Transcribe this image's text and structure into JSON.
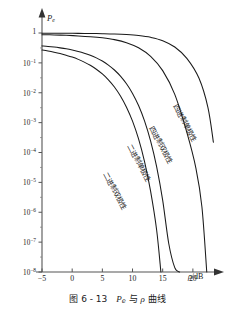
{
  "figure": {
    "caption_prefix": "图",
    "caption_number": "6 - 13",
    "caption_symbol_main": "P",
    "caption_symbol_sub": "e",
    "caption_middle": "与",
    "caption_rho": "ρ",
    "caption_suffix": "曲线",
    "caption_full": "图 6 - 13  Pe 与 ρ 曲线"
  },
  "axes": {
    "y_label_main": "P",
    "y_label_sub": "e",
    "x_label": "ρ/dB",
    "x_label_symbol": "ρ",
    "x_label_unit": "/dB",
    "y_ticks": [
      {
        "mantissa": "1",
        "exponent": "",
        "value": 0
      },
      {
        "mantissa": "10",
        "exponent": "-1",
        "value": -1
      },
      {
        "mantissa": "10",
        "exponent": "-2",
        "value": -2
      },
      {
        "mantissa": "10",
        "exponent": "-3",
        "value": -3
      },
      {
        "mantissa": "10",
        "exponent": "-4",
        "value": -4
      },
      {
        "mantissa": "10",
        "exponent": "-5",
        "value": -5
      },
      {
        "mantissa": "10",
        "exponent": "-6",
        "value": -6
      },
      {
        "mantissa": "10",
        "exponent": "-7",
        "value": -7
      },
      {
        "mantissa": "10",
        "exponent": "-8",
        "value": -8
      }
    ],
    "x_ticks": [
      "-5",
      "0",
      "5",
      "10",
      "15",
      "20"
    ]
  },
  "chart_data": {
    "type": "line",
    "xlabel": "ρ/dB",
    "ylabel": "Pe",
    "xlim": [
      -5,
      23.5
    ],
    "ylim": [
      1e-08,
      1
    ],
    "yscale": "log",
    "grid": false,
    "legend": "inline-curve-labels",
    "line_color": "#1a1a1a",
    "series": [
      {
        "name": "二进制双极性",
        "label_angle_deg": 62,
        "x": [
          -5,
          -4,
          -3,
          -2,
          -1,
          0,
          1,
          2,
          3,
          4,
          5,
          6,
          7,
          8,
          9,
          10,
          11,
          12,
          13,
          14,
          14.7
        ],
        "y": [
          0.27,
          0.25,
          0.228,
          0.205,
          0.18,
          0.156,
          0.131,
          0.106,
          0.0828,
          0.0614,
          0.0425,
          0.0271,
          0.0156,
          0.00782,
          0.00329,
          0.00112,
          0.000285,
          4.9e-05,
          5e-06,
          2.5e-07,
          1e-08
        ]
      },
      {
        "name": "二进制单极性",
        "label_angle_deg": 62,
        "x": [
          -5,
          -4,
          -3,
          -2,
          -1,
          0,
          1,
          2,
          3,
          4,
          5,
          6,
          7,
          8,
          9,
          10,
          11,
          12,
          13,
          14,
          15,
          16,
          17,
          17.8
        ],
        "y": [
          0.37,
          0.355,
          0.338,
          0.318,
          0.296,
          0.27,
          0.242,
          0.212,
          0.18,
          0.147,
          0.115,
          0.0845,
          0.0577,
          0.036,
          0.0199,
          0.00948,
          0.00372,
          0.00112,
          0.00024,
          3.3e-05,
          2.5e-06,
          9e-08,
          1.4e-08,
          1e-08
        ]
      },
      {
        "name": "四进制双极性",
        "label_angle_deg": 62,
        "x": [
          -5,
          -3,
          -1,
          1,
          3,
          5,
          7,
          9,
          11,
          13,
          15,
          17,
          19,
          20.5,
          21.5,
          22.3
        ],
        "y": [
          0.88,
          0.86,
          0.835,
          0.8,
          0.755,
          0.69,
          0.6,
          0.475,
          0.32,
          0.165,
          0.055,
          0.0088,
          0.00047,
          3e-05,
          1.5e-06,
          1e-08
        ]
      },
      {
        "name": "四进制单极性",
        "label_angle_deg": 62,
        "x": [
          -5,
          -3,
          -1,
          1,
          3,
          5,
          7,
          9,
          11,
          13,
          15,
          17,
          19,
          21,
          22.5,
          23.4
        ],
        "y": [
          0.985,
          0.982,
          0.978,
          0.972,
          0.962,
          0.948,
          0.925,
          0.885,
          0.82,
          0.715,
          0.555,
          0.34,
          0.142,
          0.031,
          0.0032,
          0.00022
        ]
      }
    ]
  },
  "curve_labels": [
    {
      "text": "二进制双极性"
    },
    {
      "text": "二进制单极性"
    },
    {
      "text": "四进制双极性"
    },
    {
      "text": "四进制单极性"
    }
  ]
}
